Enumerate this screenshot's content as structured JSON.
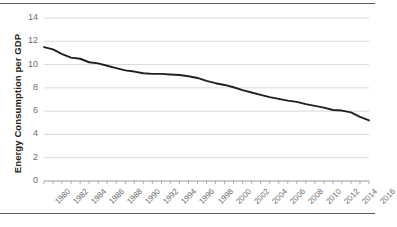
{
  "chart_data": {
    "type": "line",
    "title": "",
    "subtitle": "",
    "xlabel": "",
    "ylabel": "Energy Consumption per GDP",
    "xlim": [
      1980,
      2016
    ],
    "ylim": [
      0,
      14
    ],
    "yticks": [
      0,
      2,
      4,
      6,
      8,
      10,
      12,
      14
    ],
    "ytick_labels": [
      "0",
      "2",
      "4",
      "6",
      "8",
      "10",
      "12",
      "14"
    ],
    "xticks": [
      1980,
      1982,
      1984,
      1986,
      1988,
      1990,
      1992,
      1994,
      1996,
      1998,
      2000,
      2002,
      2004,
      2006,
      2008,
      2010,
      2012,
      2014,
      2016
    ],
    "xtick_labels": [
      "1980",
      "1982",
      "1984",
      "1986",
      "1988",
      "1990",
      "1992",
      "1994",
      "1996",
      "1998",
      "2000",
      "2002",
      "2004",
      "2006",
      "2008",
      "2010",
      "2012",
      "2014",
      "2016"
    ],
    "grid": true,
    "grid_axis": "y",
    "legend": false,
    "legend_position": "none",
    "line_color": "#231f20",
    "grid_color": "#d9d9d9",
    "x": [
      1980,
      1981,
      1982,
      1983,
      1984,
      1985,
      1986,
      1987,
      1988,
      1989,
      1990,
      1991,
      1992,
      1993,
      1994,
      1995,
      1996,
      1997,
      1998,
      1999,
      2000,
      2001,
      2002,
      2003,
      2004,
      2005,
      2006,
      2007,
      2008,
      2009,
      2010,
      2011,
      2012,
      2013,
      2014,
      2015,
      2016
    ],
    "values": [
      11.5,
      11.3,
      10.9,
      10.6,
      10.5,
      10.2,
      10.1,
      9.9,
      9.7,
      9.5,
      9.4,
      9.25,
      9.2,
      9.2,
      9.15,
      9.1,
      9.0,
      8.85,
      8.6,
      8.4,
      8.25,
      8.05,
      7.8,
      7.6,
      7.4,
      7.2,
      7.05,
      6.9,
      6.8,
      6.6,
      6.45,
      6.3,
      6.1,
      6.05,
      5.9,
      5.5,
      5.2
    ],
    "series_name": "Energy Consumption per GDP"
  }
}
